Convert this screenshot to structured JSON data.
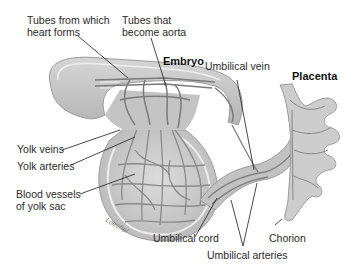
{
  "diagram": {
    "title_labels": {
      "embryo": "Embryo",
      "placenta": "Placenta"
    },
    "labels": [
      {
        "id": "heart-tubes",
        "text_lines": [
          "Tubes from which",
          "heart forms"
        ]
      },
      {
        "id": "aorta-tubes",
        "text_lines": [
          "Tubes that",
          "become aorta"
        ]
      },
      {
        "id": "umbilical-vein",
        "text_lines": [
          "Umbilical vein"
        ]
      },
      {
        "id": "yolk-veins",
        "text_lines": [
          "Yolk veins"
        ]
      },
      {
        "id": "yolk-arteries",
        "text_lines": [
          "Yolk arteries"
        ]
      },
      {
        "id": "yolk-sac-vessels",
        "text_lines": [
          "Blood vessels",
          "of yolk sac"
        ]
      },
      {
        "id": "umbilical-cord",
        "text_lines": [
          "Umbilical cord"
        ]
      },
      {
        "id": "chorion",
        "text_lines": [
          "Chorion"
        ]
      },
      {
        "id": "umbilical-arteries",
        "text_lines": [
          "Umbilical arteries"
        ]
      }
    ],
    "signature": "Loechel",
    "colors": {
      "tissue": "#c9c9c9",
      "tissue_dark": "#a8a8a8",
      "vessel": "#8a8a8a",
      "outline": "#9a9a9a",
      "leader_line": "#1a1a1a",
      "text": "#2a2a2a"
    }
  }
}
